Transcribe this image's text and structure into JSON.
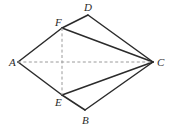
{
  "figure": {
    "background_color": "#ffffff",
    "solid_stroke_color": "#2b2b2b",
    "dashed_stroke_color": "#9a9a9a"
  },
  "labels": {
    "A": "A",
    "B": "B",
    "C": "C",
    "D": "D",
    "E": "E",
    "F": "F"
  },
  "chart_data": {
    "type": "scatter",
    "xlabel": "",
    "ylabel": "",
    "grid": false,
    "legend": "none",
    "xlim": [
      0,
      170
    ],
    "ylim": [
      0,
      134
    ],
    "points": [
      {
        "name": "A",
        "x": 18,
        "y": 62,
        "label": "A",
        "label_x": 9,
        "label_y": 66
      },
      {
        "name": "F",
        "x": 62,
        "y": 28,
        "label": "F",
        "label_x": 55,
        "label_y": 26
      },
      {
        "name": "D",
        "x": 88,
        "y": 15,
        "label": "D",
        "label_x": 84,
        "label_y": 11
      },
      {
        "name": "C",
        "x": 153,
        "y": 62,
        "label": "C",
        "label_x": 157,
        "label_y": 66
      },
      {
        "name": "B",
        "x": 85,
        "y": 110,
        "label": "B",
        "label_x": 82,
        "label_y": 124
      },
      {
        "name": "E",
        "x": 62,
        "y": 95,
        "label": "E",
        "label_x": 55,
        "label_y": 106
      }
    ],
    "segments": [
      {
        "name": "A-F",
        "from": "A",
        "to": "F",
        "style": "solid"
      },
      {
        "name": "F-D",
        "from": "F",
        "to": "D",
        "style": "solid"
      },
      {
        "name": "D-C",
        "from": "D",
        "to": "C",
        "style": "solid"
      },
      {
        "name": "F-C",
        "from": "F",
        "to": "C",
        "style": "solid"
      },
      {
        "name": "A-E",
        "from": "A",
        "to": "E",
        "style": "solid"
      },
      {
        "name": "E-B",
        "from": "E",
        "to": "B",
        "style": "solid"
      },
      {
        "name": "B-C",
        "from": "B",
        "to": "C",
        "style": "solid"
      },
      {
        "name": "E-C",
        "from": "E",
        "to": "C",
        "style": "solid"
      },
      {
        "name": "A-C",
        "from": "A",
        "to": "C",
        "style": "dashed"
      },
      {
        "name": "F-E",
        "from": "F",
        "to": "E",
        "style": "dashed"
      }
    ],
    "center_intersection": {
      "x": 62,
      "y": 62
    }
  }
}
